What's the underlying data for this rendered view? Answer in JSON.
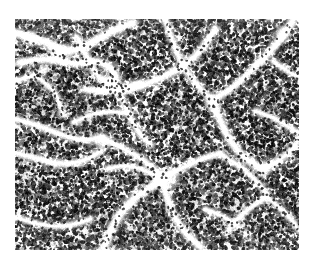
{
  "page": {
    "background_color": "#ffffff",
    "width": 314,
    "height": 266
  },
  "figure": {
    "type": "histopathology-micrograph",
    "caption": "",
    "stain": "hematoxylin and eosin",
    "rendering": "grayscale",
    "position": {
      "x": 15,
      "y": 19,
      "width": 284,
      "height": 231
    },
    "border": "none",
    "colors": {
      "background_light": "#ecebe9",
      "nuclei_dark": "#2e2c2b",
      "nuclei_mid": "#6d6a68",
      "septa_pale": "#f4f3f1",
      "page": "#ffffff"
    },
    "texture": {
      "nuclei_count": 19000,
      "nucleus_min_radius": 0.7,
      "nucleus_max_radius": 2.0,
      "septa_count": 26,
      "seed": 20240517
    },
    "septa_paths": [
      {
        "points": [
          [
            0,
            14
          ],
          [
            26,
            20
          ],
          [
            52,
            34
          ],
          [
            74,
            26
          ],
          [
            96,
            12
          ],
          [
            118,
            4
          ]
        ],
        "width": 7
      },
      {
        "points": [
          [
            4,
            44
          ],
          [
            30,
            38
          ],
          [
            58,
            46
          ],
          [
            84,
            40
          ],
          [
            104,
            56
          ],
          [
            92,
            74
          ],
          [
            70,
            70
          ]
        ],
        "width": 6
      },
      {
        "points": [
          [
            62,
            18
          ],
          [
            72,
            40
          ],
          [
            86,
            62
          ],
          [
            104,
            70
          ],
          [
            126,
            64
          ]
        ],
        "width": 5
      },
      {
        "points": [
          [
            86,
            70
          ],
          [
            104,
            74
          ],
          [
            124,
            68
          ],
          [
            148,
            58
          ],
          [
            170,
            46
          ],
          [
            188,
            30
          ],
          [
            200,
            10
          ]
        ],
        "width": 6
      },
      {
        "points": [
          [
            104,
            72
          ],
          [
            112,
            92
          ],
          [
            122,
            112
          ],
          [
            136,
            126
          ]
        ],
        "width": 5
      },
      {
        "points": [
          [
            150,
            0
          ],
          [
            158,
            24
          ],
          [
            168,
            48
          ],
          [
            182,
            66
          ],
          [
            196,
            80
          ]
        ],
        "width": 5
      },
      {
        "points": [
          [
            196,
            82
          ],
          [
            214,
            72
          ],
          [
            232,
            56
          ],
          [
            250,
            38
          ],
          [
            266,
            20
          ],
          [
            278,
            2
          ]
        ],
        "width": 6
      },
      {
        "points": [
          [
            198,
            84
          ],
          [
            206,
            104
          ],
          [
            216,
            124
          ],
          [
            230,
            140
          ],
          [
            248,
            150
          ]
        ],
        "width": 6
      },
      {
        "points": [
          [
            248,
            150
          ],
          [
            264,
            142
          ],
          [
            280,
            128
          ],
          [
            284,
            118
          ]
        ],
        "width": 5
      },
      {
        "points": [
          [
            240,
            92
          ],
          [
            258,
            98
          ],
          [
            274,
            108
          ],
          [
            284,
            114
          ]
        ],
        "width": 4
      },
      {
        "points": [
          [
            0,
            100
          ],
          [
            22,
            106
          ],
          [
            46,
            116
          ],
          [
            68,
            122
          ],
          [
            88,
            118
          ]
        ],
        "width": 5
      },
      {
        "points": [
          [
            0,
            134
          ],
          [
            24,
            140
          ],
          [
            48,
            146
          ],
          [
            70,
            142
          ],
          [
            86,
            132
          ]
        ],
        "width": 5
      },
      {
        "points": [
          [
            88,
            120
          ],
          [
            110,
            130
          ],
          [
            130,
            142
          ],
          [
            146,
            156
          ]
        ],
        "width": 5
      },
      {
        "points": [
          [
            146,
            158
          ],
          [
            166,
            150
          ],
          [
            186,
            140
          ],
          [
            206,
            134
          ]
        ],
        "width": 5
      },
      {
        "points": [
          [
            148,
            160
          ],
          [
            152,
            180
          ],
          [
            160,
            200
          ],
          [
            172,
            216
          ],
          [
            186,
            228
          ]
        ],
        "width": 6
      },
      {
        "points": [
          [
            146,
            162
          ],
          [
            128,
            172
          ],
          [
            112,
            186
          ],
          [
            100,
            202
          ],
          [
            92,
            220
          ],
          [
            88,
            231
          ]
        ],
        "width": 7
      },
      {
        "points": [
          [
            146,
            160
          ],
          [
            128,
            150
          ],
          [
            110,
            146
          ],
          [
            92,
            150
          ]
        ],
        "width": 4
      },
      {
        "points": [
          [
            206,
            136
          ],
          [
            224,
            146
          ],
          [
            240,
            160
          ],
          [
            252,
            176
          ]
        ],
        "width": 4
      },
      {
        "points": [
          [
            252,
            178
          ],
          [
            266,
            190
          ],
          [
            278,
            202
          ],
          [
            284,
            212
          ]
        ],
        "width": 4
      },
      {
        "points": [
          [
            252,
            178
          ],
          [
            236,
            188
          ],
          [
            222,
            200
          ],
          [
            212,
            214
          ]
        ],
        "width": 4
      },
      {
        "points": [
          [
            0,
            198
          ],
          [
            18,
            204
          ],
          [
            38,
            208
          ],
          [
            58,
            206
          ],
          [
            76,
            200
          ]
        ],
        "width": 4
      },
      {
        "points": [
          [
            20,
            56
          ],
          [
            34,
            66
          ],
          [
            44,
            80
          ],
          [
            48,
            96
          ]
        ],
        "width": 4
      },
      {
        "points": [
          [
            0,
            62
          ],
          [
            16,
            58
          ],
          [
            30,
            50
          ]
        ],
        "width": 4
      },
      {
        "points": [
          [
            258,
            42
          ],
          [
            272,
            52
          ],
          [
            284,
            58
          ]
        ],
        "width": 4
      },
      {
        "points": [
          [
            190,
            190
          ],
          [
            206,
            196
          ],
          [
            222,
            206
          ],
          [
            234,
            218
          ]
        ],
        "width": 4
      },
      {
        "points": [
          [
            110,
            94
          ],
          [
            92,
            92
          ],
          [
            74,
            96
          ],
          [
            58,
            104
          ]
        ],
        "width": 4
      }
    ],
    "pale_blobs": [
      {
        "cx": 96,
        "cy": 62,
        "rx": 13,
        "ry": 9,
        "rot": -22
      },
      {
        "cx": 44,
        "cy": 34,
        "rx": 16,
        "ry": 8,
        "rot": 18
      },
      {
        "cx": 150,
        "cy": 160,
        "rx": 18,
        "ry": 11,
        "rot": -12
      },
      {
        "cx": 198,
        "cy": 84,
        "rx": 11,
        "ry": 8,
        "rot": 34
      },
      {
        "cx": 248,
        "cy": 150,
        "rx": 12,
        "ry": 8,
        "rot": -28
      },
      {
        "cx": 16,
        "cy": 20,
        "rx": 12,
        "ry": 7,
        "rot": 8
      },
      {
        "cx": 268,
        "cy": 14,
        "rx": 10,
        "ry": 7,
        "rot": -40
      },
      {
        "cx": 88,
        "cy": 124,
        "rx": 10,
        "ry": 7,
        "rot": 26
      }
    ]
  }
}
